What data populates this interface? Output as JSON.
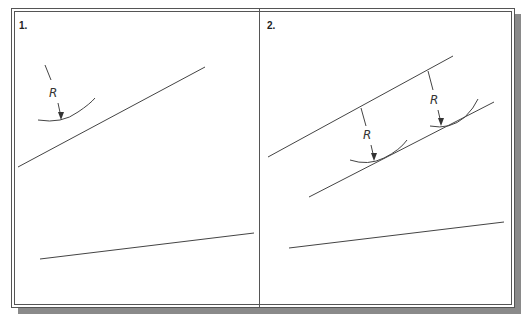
{
  "figure": {
    "panels": [
      {
        "label": "1.",
        "dimension_label": "R",
        "description": "Arc of radius R drawn tangent offset from an inclined line; a second line below"
      },
      {
        "label": "2.",
        "dimension_label_left": "R",
        "dimension_label_right": "R",
        "description": "Two arcs of radius R locate a line parallel to the inclined line at distance R"
      }
    ],
    "colors": {
      "line": "#444444",
      "frame": "#555555",
      "shadow": "#8a8a8a"
    }
  }
}
